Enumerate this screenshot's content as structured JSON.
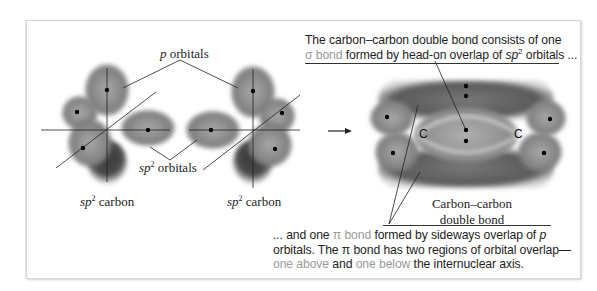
{
  "diagram": {
    "labels": {
      "p_orbitals": {
        "italic": "p",
        "text": " orbitals"
      },
      "sp2_orbitals": {
        "italic": "sp",
        "sup": "2",
        "text": " orbitals"
      },
      "sp2_carbon_left": {
        "italic": "sp",
        "sup": "2",
        "text": " carbon"
      },
      "sp2_carbon_right": {
        "italic": "sp",
        "sup": "2",
        "text": " carbon"
      },
      "carbon_carbon_line1": "Carbon–carbon",
      "carbon_carbon_line2": "double bond",
      "atom_left": "C",
      "atom_right": "C"
    },
    "top_note": {
      "line1": "The carbon–carbon double bond consists of one",
      "sigma_bond": "σ bond",
      "line2_rest": " formed by head-on overlap of ",
      "sp": "sp",
      "sup": "2",
      "line2_end": " orbitals ..."
    },
    "bottom_note": {
      "prefix": "... and one ",
      "pi_bond": "π bond",
      "mid": " formed by sideways overlap of ",
      "p": "p",
      "line2": "orbitals. The π bond has two regions of orbital overlap—",
      "one_above": "one above",
      "and": " and ",
      "one_below": "one below",
      "end": " the internuclear axis."
    },
    "colors": {
      "orbital_dark": "#3c3c3c",
      "orbital_mid": "#7a7a7a",
      "highlight_text": "#9a9a9a",
      "text": "#1e1e1e",
      "frame_border": "#d8d8d8"
    },
    "arrow": "reaction-arrow"
  }
}
